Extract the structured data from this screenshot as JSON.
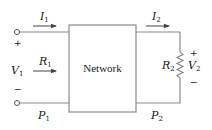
{
  "diagram": {
    "type": "two-port network circuit",
    "box_label": "Network",
    "input": {
      "current": {
        "symbol": "I",
        "sub": "1"
      },
      "voltage": {
        "symbol": "V",
        "sub": "1"
      },
      "resistance": {
        "symbol": "R",
        "sub": "1"
      },
      "power": {
        "symbol": "P",
        "sub": "1"
      },
      "plus": "+",
      "minus": "−"
    },
    "output": {
      "current": {
        "symbol": "I",
        "sub": "2"
      },
      "voltage": {
        "symbol": "V",
        "sub": "2"
      },
      "resistance": {
        "symbol": "R",
        "sub": "2"
      },
      "power": {
        "symbol": "P",
        "sub": "2"
      },
      "plus": "+",
      "minus": "−"
    },
    "colors": {
      "wire": "#8a8a8a",
      "text": "#1a1a1a",
      "background": "#ffffff"
    }
  }
}
